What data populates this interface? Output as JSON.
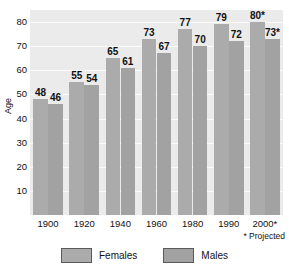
{
  "chart_data": {
    "type": "bar",
    "title": "",
    "xlabel": "",
    "ylabel": "Age",
    "ylim": [
      0,
      85
    ],
    "yticks": [
      10,
      20,
      30,
      40,
      50,
      60,
      70,
      80
    ],
    "grid": true,
    "legend_position": "bottom",
    "categories": [
      "1900",
      "1920",
      "1940",
      "1960",
      "1980",
      "1990",
      "2000*"
    ],
    "series": [
      {
        "name": "Females",
        "color": "#ababab",
        "values": [
          48,
          55,
          65,
          73,
          77,
          79,
          80
        ],
        "labels": [
          "48",
          "55",
          "65",
          "73",
          "77",
          "79",
          "80*"
        ]
      },
      {
        "name": "Males",
        "color": "#a2a2a2",
        "values": [
          46,
          54,
          61,
          67,
          70,
          72,
          73
        ],
        "labels": [
          "46",
          "54",
          "61",
          "67",
          "70",
          "72",
          "73*"
        ]
      }
    ],
    "annotations": [
      "* Projected"
    ]
  },
  "axis": {
    "y_title": "Age",
    "y_tick_labels": [
      "80",
      "70",
      "60",
      "50",
      "40",
      "30",
      "20",
      "10"
    ],
    "x_tick_labels": [
      "1900",
      "1920",
      "1940",
      "1960",
      "1980",
      "1990",
      "2000*"
    ]
  },
  "footnote": {
    "text": "* Projected"
  },
  "legend": {
    "items": [
      {
        "label": "Females",
        "color": "#ababab"
      },
      {
        "label": "Males",
        "color": "#a2a2a2"
      }
    ]
  }
}
